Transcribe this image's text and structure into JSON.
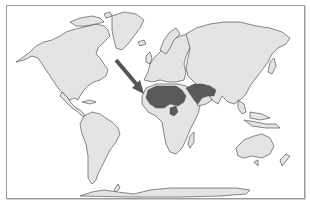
{
  "map": {
    "type": "world-map",
    "projection": "equirectangular",
    "colors": {
      "background": "#ffffff",
      "land": "#e4e4e4",
      "coastline": "#3a3a3a",
      "highlight": "#5a5a5a",
      "arrow": "#555555",
      "frame": "#9a9a9a"
    },
    "highlighted_region": "North Africa and Middle East arid zone (Sahara, Arabian Peninsula, Iran/Pakistan)",
    "annotation": {
      "type": "arrow",
      "points_to": "Northwest Africa",
      "icon": "arrow-icon"
    },
    "continents": [
      "North America",
      "Greenland",
      "South America",
      "Europe",
      "Africa",
      "Asia",
      "Australia",
      "Antarctica"
    ]
  }
}
